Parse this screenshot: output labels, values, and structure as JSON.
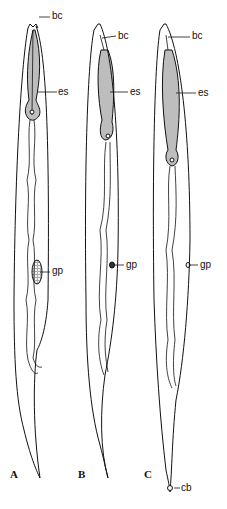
{
  "figure": {
    "panels": [
      {
        "id": "A",
        "label": "A",
        "labels": {
          "bc": "bc",
          "es": "es",
          "gp": "gp"
        }
      },
      {
        "id": "B",
        "label": "B",
        "labels": {
          "bc": "bc",
          "es": "es",
          "gp": "gp"
        }
      },
      {
        "id": "C",
        "label": "C",
        "labels": {
          "bc": "bc",
          "es": "es",
          "gp": "gp",
          "cb": "cb"
        }
      }
    ],
    "colors": {
      "ink": "#111111",
      "background": "#ffffff"
    }
  }
}
